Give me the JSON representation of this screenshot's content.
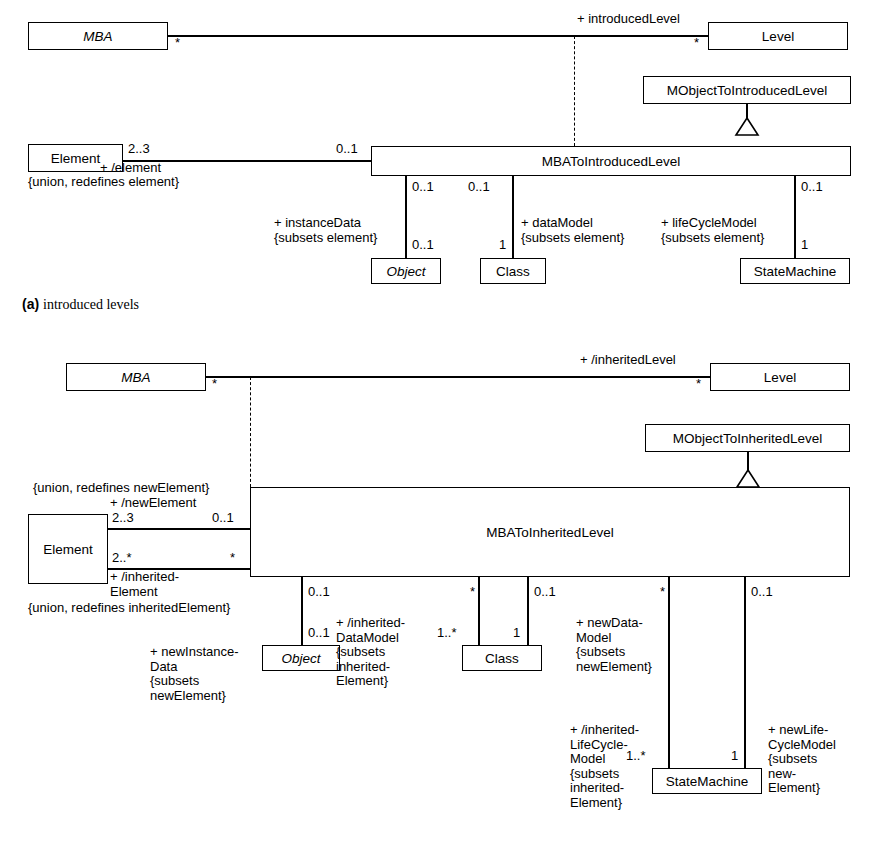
{
  "figure": {
    "caption_a": "(a)",
    "caption_a_text": "introduced levels",
    "caption_b": "(b)",
    "caption_b_text": "inherited levels"
  },
  "diagram_a": {
    "title": "introduced levels",
    "classes": [
      {
        "id": "mba",
        "name": "MBA",
        "italic": true
      },
      {
        "id": "level",
        "name": "Level",
        "italic": false
      },
      {
        "id": "mobject",
        "name": "MObjectToIntroducedLevel",
        "italic": false
      },
      {
        "id": "assoc",
        "name": "MBAToIntroducedLevel",
        "italic": false
      },
      {
        "id": "element",
        "name": "Element",
        "italic": false
      },
      {
        "id": "object",
        "name": "Object",
        "italic": true
      },
      {
        "id": "class",
        "name": "Class",
        "italic": false
      },
      {
        "id": "statemachine",
        "name": "StateMachine",
        "italic": false
      }
    ],
    "roles": [
      {
        "id": "introducedLevel",
        "text": "+ introducedLevel"
      },
      {
        "id": "element_role",
        "text": "+ /element"
      },
      {
        "id": "element_constraint",
        "text": "{union, redefines element}"
      },
      {
        "id": "instanceData",
        "text": "+ instanceData"
      },
      {
        "id": "instanceData_constraint",
        "text": "{subsets element}"
      },
      {
        "id": "dataModel",
        "text": "+ dataModel"
      },
      {
        "id": "dataModel_constraint",
        "text": "{subsets element}"
      },
      {
        "id": "lifeCycleModel",
        "text": "+ lifeCycleModel"
      },
      {
        "id": "lifeCycleModel_constraint",
        "text": "{subsets element}"
      }
    ],
    "multiplicities": {
      "mba_end": "*",
      "level_end": "*",
      "element_end": "2..3",
      "assoc_left_end": "0..1",
      "instanceData_top": "0..1",
      "instanceData_bottom": "0..1",
      "dataModel_top": "0..1",
      "dataModel_bottom": "1",
      "lifeCycleModel_top": "0..1",
      "lifeCycleModel_bottom": "1"
    }
  },
  "diagram_b": {
    "title": "inherited levels",
    "classes": [
      {
        "id": "mba",
        "name": "MBA",
        "italic": true
      },
      {
        "id": "level",
        "name": "Level",
        "italic": false
      },
      {
        "id": "mobject",
        "name": "MObjectToInheritedLevel",
        "italic": false
      },
      {
        "id": "assoc",
        "name": "MBAToInheritedLevel",
        "italic": false
      },
      {
        "id": "element",
        "name": "Element",
        "italic": false
      },
      {
        "id": "object",
        "name": "Object",
        "italic": true
      },
      {
        "id": "class",
        "name": "Class",
        "italic": false
      },
      {
        "id": "statemachine",
        "name": "StateMachine",
        "italic": false
      }
    ],
    "roles": [
      {
        "id": "inheritedLevel",
        "text": "+ /inheritedLevel"
      },
      {
        "id": "newElement_constraint",
        "text": "{union, redefines newElement}"
      },
      {
        "id": "newElement",
        "text": "+ /newElement"
      },
      {
        "id": "inheritedElement",
        "text": "+ /inherited-\nElement"
      },
      {
        "id": "inheritedElement_constraint",
        "text": "{union, redefines inheritedElement}"
      },
      {
        "id": "newInstanceData",
        "text": "+ newInstance-\nData\n{subsets\nnewElement}"
      },
      {
        "id": "inheritedDataModel",
        "text": "+ /inherited-\nDataModel\n{subsets\ninherited-\nElement}"
      },
      {
        "id": "newDataModel",
        "text": "+ newData-\nModel\n{subsets\nnewElement}"
      },
      {
        "id": "inheritedLifeCycleModel",
        "text": "+ /inherited-\nLifeCycle-\nModel\n{subsets\ninherited-\nElement}"
      },
      {
        "id": "newLifeCycleModel",
        "text": "+ newLife-\nCycleModel\n{subsets\nnew-\nElement}"
      }
    ],
    "multiplicities": {
      "mba_end": "*",
      "level_end": "*",
      "element_top": "2..3",
      "element_bottom": "2..*",
      "assoc_newElement_end": "0..1",
      "assoc_inheritedElement_end": "*",
      "newInstanceData_top": "0..1",
      "newInstanceData_bottom": "0..1",
      "inheritedDataModel_top": "*",
      "inheritedDataModel_bottom": "1..*",
      "newDataModel_top": "0..1",
      "newDataModel_bottom": "1",
      "inheritedLifeCycleModel_top": "*",
      "inheritedLifeCycleModel_bottom": "1..*",
      "newLifeCycleModel_top": "0..1",
      "newLifeCycleModel_bottom": "1"
    }
  }
}
